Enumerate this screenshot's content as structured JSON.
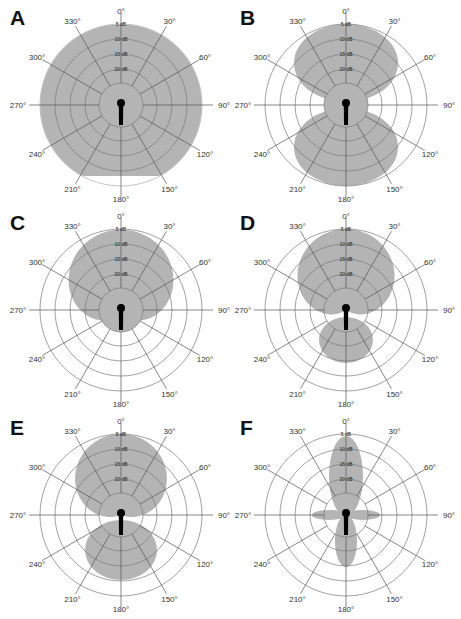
{
  "figure": {
    "fill_color": "#b4b4b4",
    "grid_color": "#555555",
    "ring_color": "#7a7a7a",
    "mic_color": "#000000"
  },
  "angles": [
    "0°",
    "30°",
    "60°",
    "90°",
    "120°",
    "150°",
    "180°",
    "210°",
    "240°",
    "270°",
    "300°",
    "330°"
  ],
  "rings_db": [
    "5 dB",
    "10 dB",
    "15 dB",
    "20 dB"
  ],
  "panels": [
    {
      "letter": "A",
      "pattern": "omnidirectional",
      "cx": 121,
      "cy": 105
    },
    {
      "letter": "B",
      "pattern": "figure-8 (bidirectional)",
      "cx": 346,
      "cy": 105
    },
    {
      "letter": "C",
      "pattern": "cardioid",
      "cx": 121,
      "cy": 310
    },
    {
      "letter": "D",
      "pattern": "supercardioid",
      "cx": 346,
      "cy": 310
    },
    {
      "letter": "E",
      "pattern": "hypercardioid",
      "cx": 121,
      "cy": 515
    },
    {
      "letter": "F",
      "pattern": "shotgun (lobar)",
      "cx": 346,
      "cy": 515
    }
  ],
  "chart_data": {
    "type": "polar",
    "title": "",
    "angle_ticks_deg": [
      0,
      30,
      60,
      90,
      120,
      150,
      180,
      210,
      240,
      270,
      300,
      330
    ],
    "radial_ticks": [
      "5 dB",
      "10 dB",
      "15 dB",
      "20 dB"
    ],
    "radial_range_db": [
      -25,
      0
    ],
    "panels": [
      {
        "label": "A",
        "pattern": "omnidirectional",
        "response_db": {
          "0": 0,
          "90": 0,
          "180": -2,
          "270": 0
        }
      },
      {
        "label": "B",
        "pattern": "figure-8",
        "response_db": {
          "0": 0,
          "90": -25,
          "180": 0,
          "270": -25
        }
      },
      {
        "label": "C",
        "pattern": "cardioid",
        "response_db": {
          "0": 0,
          "90": -3,
          "150": -12,
          "180": -25,
          "270": -3
        }
      },
      {
        "label": "D",
        "pattern": "supercardioid",
        "response_db": {
          "0": 0,
          "90": -5,
          "126": -25,
          "180": -10,
          "270": -5
        }
      },
      {
        "label": "E",
        "pattern": "hypercardioid",
        "response_db": {
          "0": 0,
          "90": -7,
          "110": -25,
          "180": -6,
          "270": -7
        }
      },
      {
        "label": "F",
        "pattern": "shotgun",
        "response_db": {
          "0": 0,
          "90": -12,
          "180": -8,
          "270": -12
        }
      }
    ]
  }
}
